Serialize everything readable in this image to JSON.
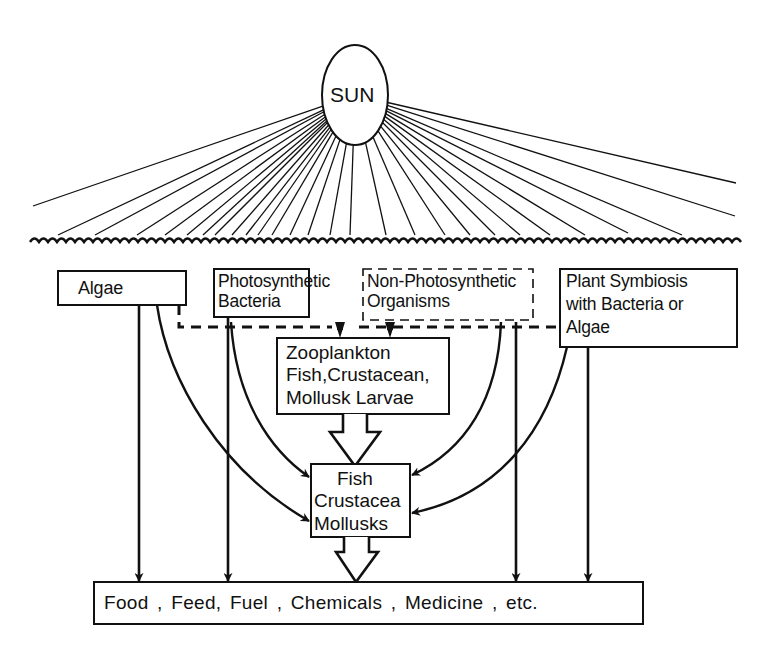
{
  "diagram": {
    "sun": {
      "label": "SUN"
    },
    "sources": [
      {
        "id": "algae",
        "label_lines": [
          "Algae"
        ],
        "border": "solid"
      },
      {
        "id": "photosynthetic-bacteria",
        "label_lines": [
          "Photosynthetic",
          "Bacteria"
        ],
        "border": "solid"
      },
      {
        "id": "non-photosynthetic-organisms",
        "label_lines": [
          "Non-Photosynthetic",
          "Organisms"
        ],
        "border": "dashed"
      },
      {
        "id": "plant-symbiosis",
        "label_lines": [
          "Plant Symbiosis",
          "with Bacteria or",
          "Algae"
        ],
        "border": "solid"
      }
    ],
    "intermediate": {
      "id": "zooplankton",
      "label_lines": [
        "Zooplankton",
        "Fish,Crustacean,",
        "Mollusk Larvae"
      ]
    },
    "consumers": {
      "id": "fish-crustacea-mollusks",
      "label_lines": [
        "Fish",
        "Crustacea",
        "Mollusks"
      ]
    },
    "output": {
      "id": "products",
      "label": "Food , Feed, Fuel , Chemicals , Medicine , etc."
    },
    "edges": [
      {
        "from": "sun",
        "to": "ocean-surface",
        "style": "rays"
      },
      {
        "from": "algae",
        "to": "zooplankton",
        "style": "dashed"
      },
      {
        "from": "photosynthetic-bacteria",
        "to": "zooplankton",
        "style": "dashed"
      },
      {
        "from": "non-photosynthetic-organisms",
        "to": "zooplankton",
        "style": "dashed"
      },
      {
        "from": "plant-symbiosis",
        "to": "zooplankton",
        "style": "dashed"
      },
      {
        "from": "algae",
        "to": "fish-crustacea-mollusks",
        "style": "curved"
      },
      {
        "from": "photosynthetic-bacteria",
        "to": "fish-crustacea-mollusks",
        "style": "curved"
      },
      {
        "from": "non-photosynthetic-organisms",
        "to": "fish-crustacea-mollusks",
        "style": "curved"
      },
      {
        "from": "plant-symbiosis",
        "to": "fish-crustacea-mollusks",
        "style": "curved"
      },
      {
        "from": "zooplankton",
        "to": "fish-crustacea-mollusks",
        "style": "hollow-block"
      },
      {
        "from": "fish-crustacea-mollusks",
        "to": "products",
        "style": "hollow-block"
      },
      {
        "from": "algae",
        "to": "products",
        "style": "straight"
      },
      {
        "from": "photosynthetic-bacteria",
        "to": "products",
        "style": "straight"
      },
      {
        "from": "non-photosynthetic-organisms",
        "to": "products",
        "style": "straight"
      },
      {
        "from": "plant-symbiosis",
        "to": "products",
        "style": "straight"
      }
    ],
    "colors": {
      "ink": "#111111",
      "background": "#ffffff"
    }
  }
}
